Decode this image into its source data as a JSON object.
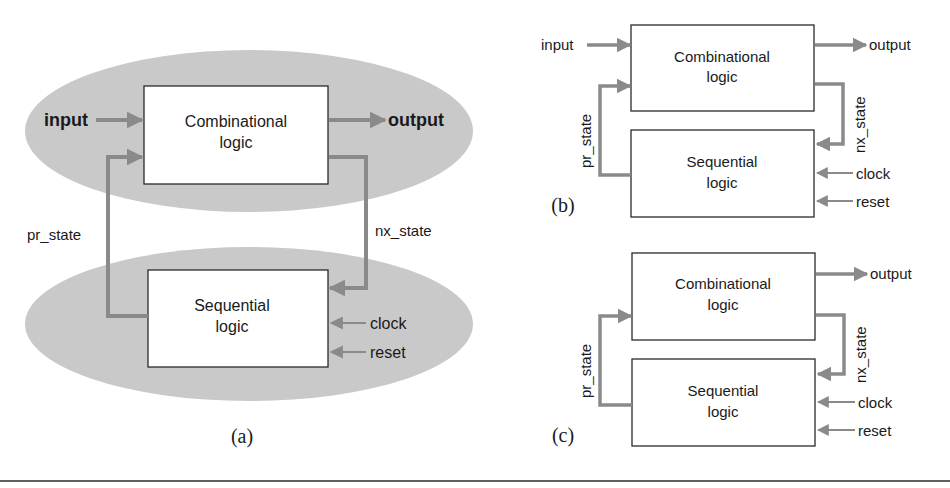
{
  "figure": {
    "panels": [
      {
        "caption": "(a)",
        "blocks": {
          "combinational_line1": "Combinational",
          "combinational_line2": "logic",
          "sequential_line1": "Sequential",
          "sequential_line2": "logic"
        },
        "signals": {
          "input": "input",
          "output": "output",
          "pr_state": "pr_state",
          "nx_state": "nx_state",
          "clock": "clock",
          "reset": "reset"
        }
      },
      {
        "caption": "(b)",
        "blocks": {
          "combinational_line1": "Combinational",
          "combinational_line2": "logic",
          "sequential_line1": "Sequential",
          "sequential_line2": "logic"
        },
        "signals": {
          "input": "input",
          "output": "output",
          "pr_state": "pr_state",
          "nx_state": "nx_state",
          "clock": "clock",
          "reset": "reset"
        }
      },
      {
        "caption": "(c)",
        "blocks": {
          "combinational_line1": "Combinational",
          "combinational_line2": "logic",
          "sequential_line1": "Sequential",
          "sequential_line2": "logic"
        },
        "signals": {
          "output": "output",
          "pr_state": "pr_state",
          "nx_state": "nx_state",
          "clock": "clock",
          "reset": "reset"
        }
      }
    ],
    "colors": {
      "ellipse_fill": "#c9c9c9",
      "arrow": "#8a8a8a",
      "box_border": "#2a2a2a",
      "text": "#1a1a1a"
    }
  }
}
